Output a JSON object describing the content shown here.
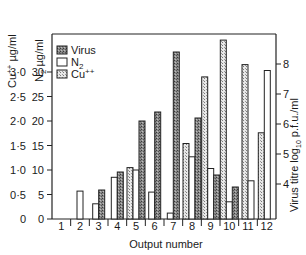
{
  "chart_data": {
    "type": "bar",
    "title": "",
    "xlabel": "Output number",
    "categories": [
      "1",
      "2",
      "3",
      "4",
      "5",
      "6",
      "7",
      "8",
      "9",
      "10",
      "11",
      "12"
    ],
    "axes": {
      "left_outer": {
        "label": "Cu++ µg/ml",
        "ticks": [
          "0",
          "0·5",
          "1·0",
          "1·5",
          "2·0",
          "2·5",
          "3·0"
        ],
        "range": [
          0,
          3.0
        ]
      },
      "left_inner": {
        "label": "N2 µg/ml",
        "ticks": [
          "0",
          "5",
          "10",
          "15",
          "20",
          "25",
          "30"
        ],
        "range": [
          0,
          30
        ]
      },
      "right": {
        "label": "Virus titre log10 p.f.u./ml",
        "ticks": [
          "4",
          "5",
          "6",
          "7",
          "8"
        ],
        "range": [
          2.87,
          8.0
        ]
      }
    },
    "legend": [
      {
        "name": "Virus",
        "pattern": "dark-stipple"
      },
      {
        "name": "N2",
        "pattern": "open"
      },
      {
        "name": "Cu++",
        "pattern": "light-stipple"
      }
    ],
    "legend_position": "top-left inside",
    "grid": false,
    "series": [
      {
        "name": "Virus",
        "axis": "right",
        "values": [
          null,
          null,
          3.8,
          4.4,
          6.1,
          6.4,
          8.4,
          6.2,
          4.3,
          3.9,
          null,
          null
        ]
      },
      {
        "name": "N2",
        "axis": "left_inner",
        "values": [
          null,
          5.7,
          3.1,
          8.5,
          10.0,
          5.5,
          1.2,
          12.7,
          10.3,
          3.5,
          7.8,
          30.3
        ]
      },
      {
        "name": "Cu++",
        "axis": "left_outer",
        "values": [
          null,
          null,
          null,
          null,
          1.05,
          null,
          null,
          1.54,
          2.9,
          3.65,
          3.15,
          1.76
        ]
      }
    ]
  },
  "labels": {
    "cu_axis": "Cu",
    "cu_sup": "++",
    "cu_unit": " µg/ml",
    "n2_axis": "N",
    "n2_sub": "2",
    "n2_unit": " µg/ml",
    "right_axis_a": "Virus titre log",
    "right_axis_sub": "10",
    "right_axis_b": " p.f.u./ml",
    "xlabel": "Output number",
    "legend_virus": "Virus",
    "legend_n2": "N",
    "legend_n2_sub": "2",
    "legend_cu": "Cu",
    "legend_cu_sup": "++"
  }
}
